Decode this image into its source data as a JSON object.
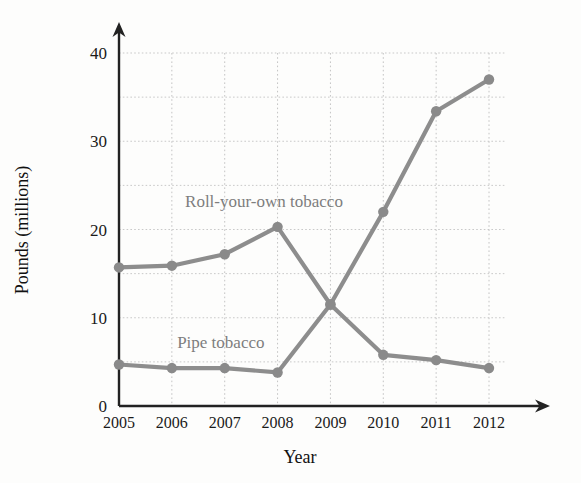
{
  "chart_data": {
    "type": "line",
    "title": "",
    "xlabel": "Year",
    "ylabel": "Pounds (millions)",
    "categories": [
      "2005",
      "2006",
      "2007",
      "2008",
      "2009",
      "2010",
      "2011",
      "2012"
    ],
    "x": [
      2005,
      2006,
      2007,
      2008,
      2009,
      2010,
      2011,
      2012
    ],
    "xlim": [
      2005,
      2012
    ],
    "ylim": [
      0,
      40
    ],
    "yticks": [
      0,
      10,
      20,
      30,
      40
    ],
    "ytick_labels": [
      "0",
      "10",
      "20",
      "30",
      "40"
    ],
    "minor_yticks": [
      5,
      15,
      25,
      35
    ],
    "grid": true,
    "grid_style": "dotted",
    "legend": "inline-annotations",
    "line_color": "#8d8d8d",
    "axis_color": "#222222",
    "grid_color": "#c9c9c9",
    "series": [
      {
        "name": "Roll-your-own tobacco",
        "label_x": 2006.25,
        "label_y": 22.6,
        "values": [
          15.7,
          15.9,
          17.2,
          20.3,
          11.5,
          22.0,
          33.4,
          37.0
        ]
      },
      {
        "name": "Pipe tobacco",
        "label_x": 2006.1,
        "label_y": 6.6,
        "values": [
          4.7,
          4.3,
          4.3,
          3.8,
          11.5,
          5.8,
          5.2,
          4.3
        ]
      }
    ]
  }
}
